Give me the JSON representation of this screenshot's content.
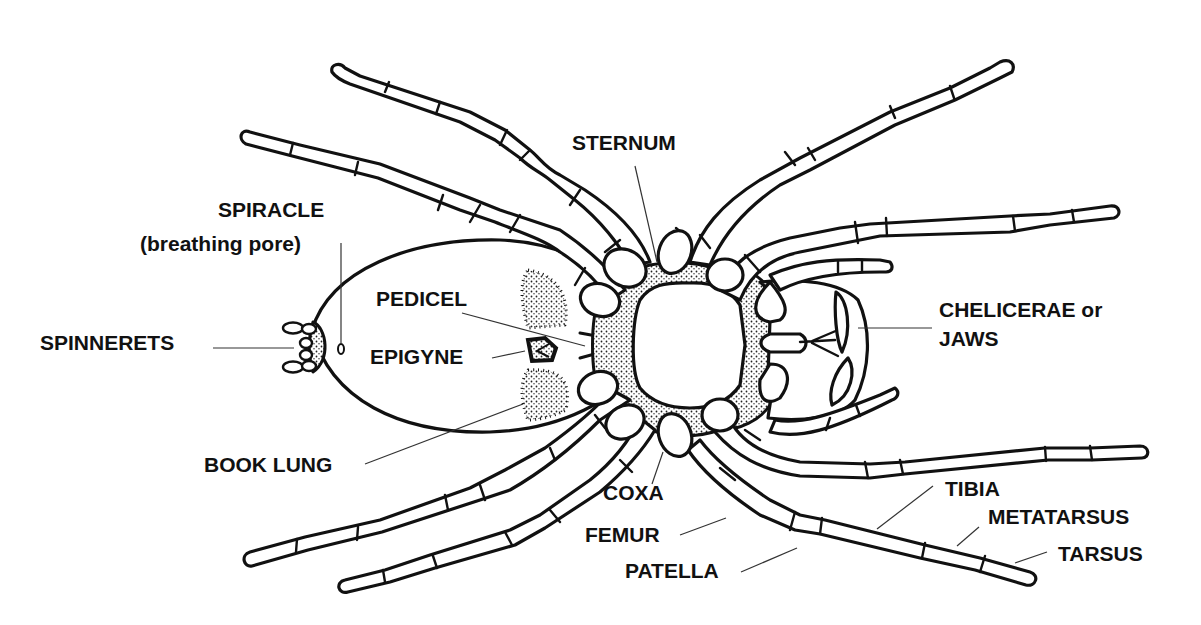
{
  "diagram": {
    "colors": {
      "ink": "#111111",
      "background": "#ffffff",
      "leader": "#333333"
    },
    "labels": {
      "sternum": "STERNUM",
      "spiracle": "SPIRACLE",
      "spiracle_note": "(breathing pore)",
      "pedicel": "PEDICEL",
      "spinnerets": "SPINNERETS",
      "epigyne": "EPIGYNE",
      "book_lung": "BOOK LUNG",
      "chelicerae_line1": "CHELICERAE or",
      "chelicerae_line2": "JAWS",
      "coxa": "COXA",
      "femur": "FEMUR",
      "patella": "PATELLA",
      "tibia": "TIBIA",
      "metatarsus": "METATARSUS",
      "tarsus": "TARSUS"
    }
  }
}
